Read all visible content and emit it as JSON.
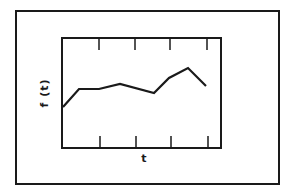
{
  "chart_data": {
    "type": "line",
    "title": "",
    "xlabel": "t",
    "ylabel": "f (t)",
    "x_ticks": 4,
    "tick_labels_shown": false,
    "grid": false,
    "legend": null,
    "series": [
      {
        "name": "f(t)",
        "points_px": [
          [
            63,
            107
          ],
          [
            79,
            89
          ],
          [
            99,
            89
          ],
          [
            120,
            84
          ],
          [
            154,
            93
          ],
          [
            169,
            78
          ],
          [
            188,
            68
          ],
          [
            206,
            86
          ]
        ],
        "x": [
          0,
          0.11,
          0.23,
          0.36,
          0.58,
          0.67,
          0.79,
          0.9
        ],
        "y": [
          0.37,
          0.53,
          0.53,
          0.58,
          0.5,
          0.63,
          0.73,
          0.56
        ]
      }
    ],
    "xlim": [
      0,
      1
    ],
    "ylim": [
      0,
      1
    ]
  },
  "colors": {
    "line": "#1a1a1a",
    "frame": "#1a1a1a",
    "background": "#ffffff"
  }
}
